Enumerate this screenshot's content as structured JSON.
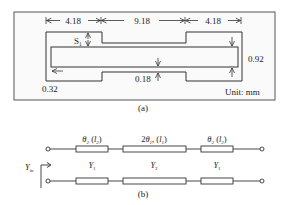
{
  "figure_a": {
    "caption": "(a)",
    "dimensions": {
      "left_section": "4.18",
      "middle_section": "9.18",
      "right_section": "4.18",
      "right_height": "0.92",
      "slot_width": "0.18",
      "left_gap": "0.32",
      "step_label": "S",
      "step_subscript": "1"
    },
    "unit_label": "Unit: mm"
  },
  "figure_b": {
    "caption": "(b)",
    "segments": [
      {
        "angle": "θ",
        "angle_sub": "2",
        "length_prefix": " (",
        "length": "l",
        "length_sub": "2",
        "length_suffix": ")",
        "admittance": "Y",
        "admittance_sub": "1"
      },
      {
        "angle": "2θ",
        "angle_sub": "1",
        "length_prefix": ", (",
        "length": "l",
        "length_sub": "1",
        "length_suffix": ")",
        "admittance": "Y",
        "admittance_sub": "2"
      },
      {
        "angle": "θ",
        "angle_sub": "2",
        "length_prefix": " (",
        "length": "l",
        "length_sub": "2",
        "length_suffix": ")",
        "admittance": "Y",
        "admittance_sub": "1"
      }
    ],
    "input_label": "Y",
    "input_sub": "in"
  },
  "colors": {
    "stroke": "#333333",
    "frame": "#555555",
    "background": "#ffffff",
    "frame_fill": "#fafafa"
  }
}
